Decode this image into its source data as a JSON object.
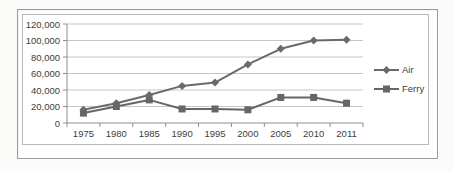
{
  "chart_data": {
    "type": "line",
    "categories": [
      "1975",
      "1980",
      "1985",
      "1990",
      "1995",
      "2000",
      "2005",
      "2010",
      "2011"
    ],
    "series": [
      {
        "name": "Air",
        "marker": "diamond",
        "color": "#6a6a6a",
        "values": [
          16000,
          24000,
          34000,
          45000,
          49000,
          71000,
          90000,
          100000,
          101000
        ]
      },
      {
        "name": "Ferry",
        "marker": "square",
        "color": "#666666",
        "values": [
          12000,
          20000,
          28000,
          17000,
          17000,
          16000,
          31000,
          31000,
          24000
        ]
      }
    ],
    "title": "",
    "xlabel": "",
    "ylabel": "",
    "ylim": [
      0,
      120000
    ],
    "y_ticks": [
      0,
      20000,
      40000,
      60000,
      80000,
      100000,
      120000
    ],
    "y_tick_labels": [
      "0",
      "20,000",
      "40,000",
      "60,000",
      "80,000",
      "100,000",
      "120,000"
    ],
    "grid": true,
    "legend_position": "right"
  },
  "colors": {
    "gridline": "#c6c6c6",
    "axis": "#8e8e8e",
    "tick": "#8e8e8e",
    "text": "#3d3d3d",
    "outer_frame_border": "#9c9c9c",
    "inner_frame_border": "#b9b9b9",
    "background": "#ffffff"
  }
}
